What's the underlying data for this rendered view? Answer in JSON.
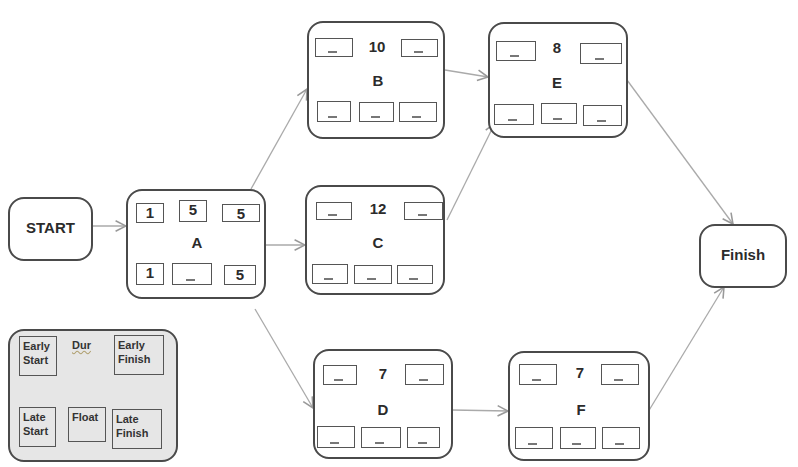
{
  "diagram": {
    "type": "activity-on-node network (CPM)",
    "start_label": "START",
    "finish_label": "Finish",
    "nodes": {
      "A": {
        "name": "A",
        "duration": "5",
        "es": "1",
        "ef": "5",
        "ls": "1",
        "float": "_",
        "lf": "5"
      },
      "B": {
        "name": "B",
        "duration": "10",
        "es": "",
        "ef": "",
        "ls": "",
        "float": "",
        "lf": ""
      },
      "C": {
        "name": "C",
        "duration": "12",
        "es": "",
        "ef": "",
        "ls": "",
        "float": "",
        "lf": ""
      },
      "D": {
        "name": "D",
        "duration": "7",
        "es": "",
        "ef": "",
        "ls": "",
        "float": "",
        "lf": ""
      },
      "E": {
        "name": "E",
        "duration": "8",
        "es": "",
        "ef": "",
        "ls": "",
        "float": "",
        "lf": ""
      },
      "F": {
        "name": "F",
        "duration": "7",
        "es": "",
        "ef": "",
        "ls": "",
        "float": "",
        "lf": ""
      }
    },
    "edges": [
      [
        "START",
        "A"
      ],
      [
        "A",
        "B"
      ],
      [
        "A",
        "C"
      ],
      [
        "A",
        "D"
      ],
      [
        "B",
        "E"
      ],
      [
        "C",
        "E"
      ],
      [
        "D",
        "F"
      ],
      [
        "E",
        "Finish"
      ],
      [
        "F",
        "Finish"
      ]
    ],
    "legend": {
      "early_start": "Early Start",
      "duration": "Dur",
      "early_finish": "Early Finish",
      "late_start": "Late Start",
      "float": "Float",
      "late_finish": "Late Finish"
    },
    "colors": {
      "border": "#4a4a4a",
      "edge": "#aaaaaa",
      "legend_fill": "#e6e6e6"
    }
  }
}
